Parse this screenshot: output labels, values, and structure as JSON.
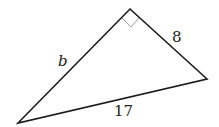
{
  "diagram": {
    "type": "right-triangle",
    "vertices": {
      "top": [
        130,
        9
      ],
      "right": [
        207,
        79
      ],
      "bottom_left": [
        18,
        123
      ]
    },
    "right_angle_at": "top",
    "labels": {
      "left_leg": "b",
      "right_leg": "8",
      "hypotenuse": "17"
    },
    "colors": {
      "stroke": "#1a1a1a",
      "right_angle_marker": "#9a9a9a"
    }
  }
}
